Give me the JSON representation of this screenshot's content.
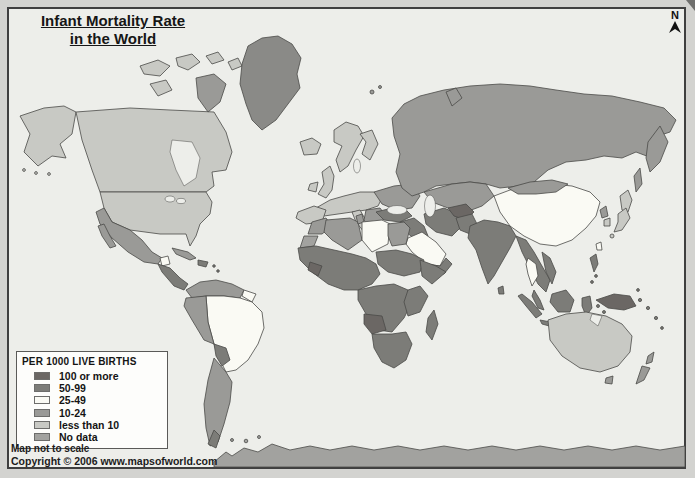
{
  "page": {
    "background_color": "#d3d3d0",
    "title_line1": "Infant Mortality Rate",
    "title_line2": "in the World",
    "compass_label": "N",
    "note": "Map not to scale",
    "copyright": "Copyright © 2006 www.mapsofworld.com"
  },
  "legend": {
    "title": "PER 1000 LIVE BIRTHS",
    "items": [
      {
        "key": "c100",
        "label": "100 or more",
        "color": "#6b6764"
      },
      {
        "key": "c50",
        "label": "50-99",
        "color": "#7c7c78"
      },
      {
        "key": "c25",
        "label": "25-49",
        "color": "#fafaf4"
      },
      {
        "key": "c10",
        "label": "10-24",
        "color": "#9a9a97"
      },
      {
        "key": "cless",
        "label": "less than 10",
        "color": "#c8c9c4"
      },
      {
        "key": "cnodata",
        "label": "No data",
        "color": "#a2a29f"
      }
    ]
  },
  "map": {
    "ocean_color": "#edeeea",
    "frame_color": "#3f3f3f",
    "border_color": "#4a4a48",
    "greenland_color": "#8a8a87"
  }
}
